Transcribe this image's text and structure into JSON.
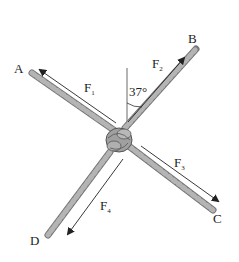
{
  "diagram": {
    "type": "force-diagram",
    "points": [
      {
        "id": "A",
        "label": "A"
      },
      {
        "id": "B",
        "label": "B"
      },
      {
        "id": "C",
        "label": "C"
      },
      {
        "id": "D",
        "label": "D"
      }
    ],
    "forces": [
      {
        "id": "F1",
        "label": "F",
        "sub": "1",
        "direction": "toward A"
      },
      {
        "id": "F2",
        "label": "F",
        "sub": "2",
        "direction": "toward B"
      },
      {
        "id": "F3",
        "label": "F",
        "sub": "3",
        "direction": "toward C"
      },
      {
        "id": "F4",
        "label": "F",
        "sub": "4",
        "direction": "toward D"
      }
    ],
    "angle": {
      "value": "37°",
      "between": "vertical and rope B"
    },
    "colors": {
      "rope": "#a8a8a8",
      "rope_stripe": "#6e6e6e",
      "arrow": "#222222",
      "text": "#222222"
    }
  }
}
